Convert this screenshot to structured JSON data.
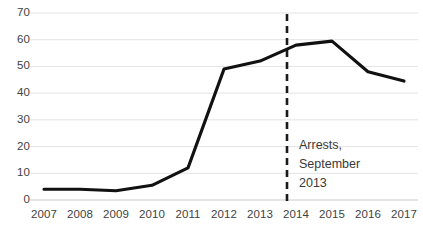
{
  "chart_data": {
    "type": "line",
    "title": "",
    "xlabel": "",
    "ylabel": "",
    "categories": [
      "2007",
      "2008",
      "2009",
      "2010",
      "2011",
      "2012",
      "2013",
      "2014",
      "2015",
      "2016",
      "2017"
    ],
    "x": [
      2007,
      2008,
      2009,
      2010,
      2011,
      2012,
      2013,
      2014,
      2015,
      2016,
      2017
    ],
    "values": [
      4,
      4,
      3.5,
      5.5,
      12,
      49,
      52,
      58,
      59.5,
      48,
      44.5
    ],
    "series": [
      {
        "name": "",
        "values": [
          4,
          4,
          3.5,
          5.5,
          12,
          49,
          52,
          58,
          59.5,
          48,
          44.5
        ]
      }
    ],
    "ylim": [
      0,
      70
    ],
    "yticks": [
      0,
      10,
      20,
      30,
      40,
      50,
      60,
      70
    ],
    "ytick_labels": [
      "0",
      "10",
      "20",
      "30",
      "40",
      "50",
      "60",
      "70"
    ],
    "xtick_labels": [
      "2007",
      "2008",
      "2009",
      "2010",
      "2011",
      "2012",
      "2013",
      "2014",
      "2015",
      "2016",
      "2017"
    ],
    "grid": "horizontal",
    "legend": "none",
    "line_color": "#111111",
    "grid_color": "#e3e3e3",
    "axis_color": "#d9d9d9",
    "text_color": "#3f3f3f",
    "annotations": [
      {
        "name": "arrests-marker",
        "type": "vertical-dashed-line",
        "x_value": 2013.75,
        "color": "#1a1a1a",
        "lines": [
          "Arrests,",
          "September",
          "2013"
        ],
        "text": "Arrests, September 2013"
      }
    ]
  }
}
